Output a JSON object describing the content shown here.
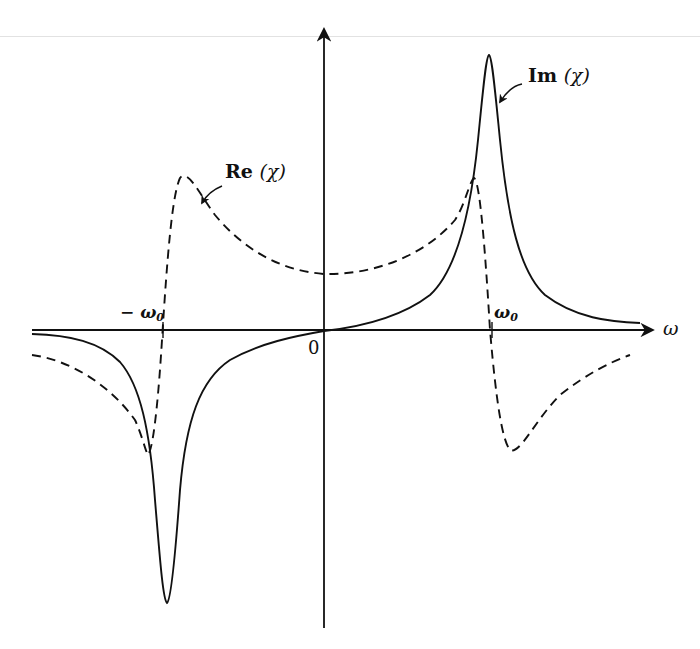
{
  "diagram": {
    "labels": {
      "im_curve": "Im",
      "re_curve": "Re",
      "chi": "(χ)",
      "omega": "ω",
      "omega0_minus": "− ω",
      "omega0": "ω",
      "zero_sub": "0",
      "origin": "0"
    },
    "curves": [
      {
        "name": "Im(χ)",
        "style": "solid",
        "shape": "antisymmetric resonance peaks",
        "peak_at": "ω0 (positive)",
        "trough_at": "−ω0 (negative)"
      },
      {
        "name": "Re(χ)",
        "style": "dashed",
        "shape": "dispersive",
        "maxima_near": [
          "−ω0 (right side)",
          "ω0 (left side)"
        ],
        "minima_near": [
          "−ω0 (left side)",
          "ω0 (right side)"
        ]
      }
    ],
    "axes": {
      "x": "ω",
      "x_ticks": [
        "−ω0",
        "0",
        "ω0"
      ],
      "y": ""
    },
    "colors": {
      "ink": "#111111",
      "background": "#ffffff",
      "rule": "#e2e2e2"
    }
  }
}
